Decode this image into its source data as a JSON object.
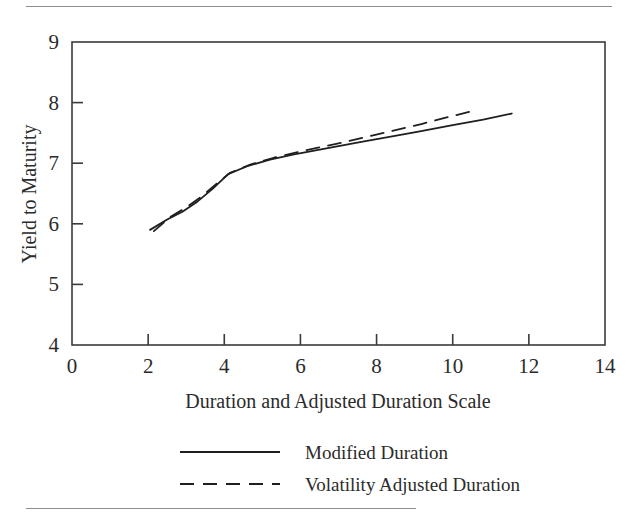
{
  "figure": {
    "name": "duration-vs-yield-figure",
    "has_top_rule": true,
    "has_bottom_rule": true
  },
  "chart_data": {
    "type": "line",
    "title": "",
    "subtitle": "",
    "xlabel": "Duration and Adjusted Duration Scale",
    "ylabel": "Yield to Maturity",
    "xlim": [
      0,
      14
    ],
    "ylim": [
      4,
      9
    ],
    "xticks": [
      0,
      2,
      4,
      6,
      8,
      10,
      12,
      14
    ],
    "yticks": [
      4,
      5,
      6,
      7,
      8,
      9
    ],
    "xtick_labels": [
      "0",
      "2",
      "4",
      "6",
      "8",
      "10",
      "12",
      "14"
    ],
    "ytick_labels": [
      "4",
      "5",
      "6",
      "7",
      "8",
      "9"
    ],
    "grid": false,
    "legend_position": "below-axis-center",
    "frame": "box",
    "series": [
      {
        "name": "Modified Duration",
        "style": "solid",
        "color": "#1f1f1f",
        "x": [
          2.05,
          2.5,
          2.9,
          3.3,
          3.7,
          4.1,
          4.6,
          5.2,
          5.8,
          6.4,
          7.0,
          7.6,
          8.3,
          9.1,
          10.0,
          10.8,
          11.55
        ],
        "y": [
          5.9,
          6.07,
          6.2,
          6.37,
          6.58,
          6.82,
          6.95,
          7.06,
          7.14,
          7.21,
          7.28,
          7.35,
          7.43,
          7.52,
          7.63,
          7.72,
          7.82
        ]
      },
      {
        "name": "Volatility Adjusted Duration",
        "style": "dashed",
        "color": "#1f1f1f",
        "x": [
          2.15,
          2.6,
          3.0,
          3.4,
          3.8,
          4.15,
          4.7,
          5.3,
          5.9,
          6.5,
          7.1,
          7.7,
          8.4,
          9.2,
          10.0,
          10.65
        ],
        "y": [
          5.88,
          6.12,
          6.27,
          6.45,
          6.66,
          6.84,
          6.98,
          7.09,
          7.18,
          7.26,
          7.34,
          7.43,
          7.53,
          7.65,
          7.78,
          7.88
        ]
      }
    ],
    "legend": [
      {
        "label": "Modified Duration",
        "style": "solid"
      },
      {
        "label": "Volatility Adjusted Duration",
        "style": "dashed"
      }
    ]
  }
}
